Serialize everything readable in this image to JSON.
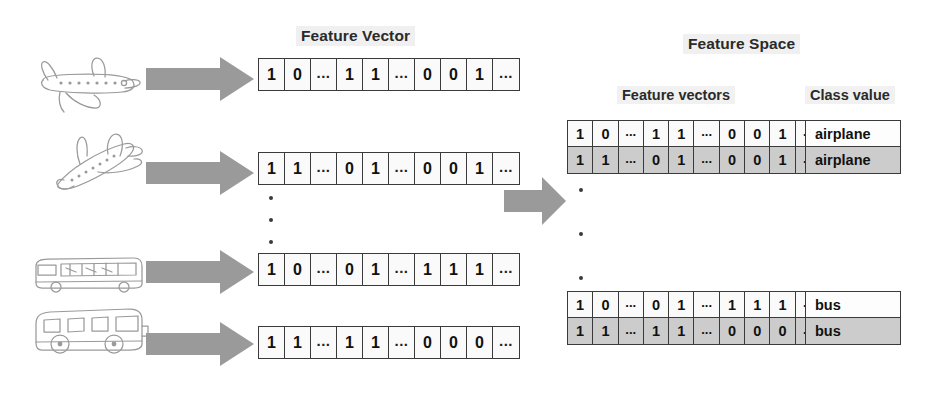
{
  "figure": {
    "title_feature_vector": "Feature Vector",
    "title_feature_space": "Feature Space",
    "subtitle_feature_vectors": "Feature vectors",
    "subtitle_class_value": "Class value",
    "accent_shaded": "#cccccc",
    "arrow_color": "#9a9a9a",
    "border_color": "#3a3a3a"
  },
  "inputs": [
    {
      "name": "airplane-sketch-level",
      "label": "airplane"
    },
    {
      "name": "airplane-sketch-tilted",
      "label": "airplane"
    },
    {
      "name": "bus-sketch-coach",
      "label": "bus"
    },
    {
      "name": "bus-sketch-city",
      "label": "bus"
    }
  ],
  "left_vectors": [
    {
      "cells": [
        "1",
        "0",
        "...",
        "1",
        "1",
        "...",
        "0",
        "0",
        "1",
        "..."
      ]
    },
    {
      "cells": [
        "1",
        "1",
        "...",
        "0",
        "1",
        "...",
        "0",
        "0",
        "1",
        "..."
      ]
    },
    {
      "cells": [
        "1",
        "0",
        "...",
        "0",
        "1",
        "...",
        "1",
        "1",
        "1",
        "..."
      ]
    },
    {
      "cells": [
        "1",
        "1",
        "...",
        "1",
        "1",
        "...",
        "0",
        "0",
        "0",
        "..."
      ]
    }
  ],
  "feature_space": {
    "groups": [
      {
        "name": "airplane-group",
        "rows": [
          {
            "cells": [
              "1",
              "0",
              "...",
              "1",
              "1",
              "...",
              "0",
              "0",
              "1",
              "..."
            ],
            "class_value": "airplane",
            "shaded": false
          },
          {
            "cells": [
              "1",
              "1",
              "...",
              "0",
              "1",
              "...",
              "0",
              "0",
              "1",
              "..."
            ],
            "class_value": "airplane",
            "shaded": true
          }
        ]
      },
      {
        "name": "bus-group",
        "rows": [
          {
            "cells": [
              "1",
              "0",
              "...",
              "0",
              "1",
              "...",
              "1",
              "1",
              "1",
              "..."
            ],
            "class_value": "bus",
            "shaded": false
          },
          {
            "cells": [
              "1",
              "1",
              "...",
              "1",
              "1",
              "...",
              "0",
              "0",
              "0",
              "..."
            ],
            "class_value": "bus",
            "shaded": true
          }
        ]
      }
    ]
  }
}
